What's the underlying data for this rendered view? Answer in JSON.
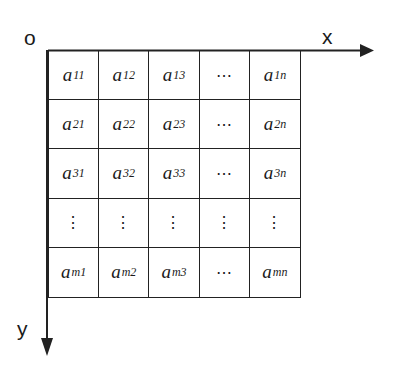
{
  "diagram": {
    "origin_label": "o",
    "x_axis_label": "x",
    "y_axis_label": "y",
    "colors": {
      "line": "#222222",
      "text": "#1a1a1a",
      "background": "#ffffff"
    },
    "matrix": {
      "rows": [
        [
          {
            "base": "a",
            "sub": "11"
          },
          {
            "base": "a",
            "sub": "12"
          },
          {
            "base": "a",
            "sub": "13"
          },
          {
            "ellipsis": "⋯"
          },
          {
            "base": "a",
            "sub": "1n"
          }
        ],
        [
          {
            "base": "a",
            "sub": "21"
          },
          {
            "base": "a",
            "sub": "22"
          },
          {
            "base": "a",
            "sub": "23"
          },
          {
            "ellipsis": "⋯"
          },
          {
            "base": "a",
            "sub": "2n"
          }
        ],
        [
          {
            "base": "a",
            "sub": "31"
          },
          {
            "base": "a",
            "sub": "32"
          },
          {
            "base": "a",
            "sub": "33"
          },
          {
            "ellipsis": "⋯"
          },
          {
            "base": "a",
            "sub": "3n"
          }
        ],
        [
          {
            "vdots": "⋮"
          },
          {
            "vdots": "⋮"
          },
          {
            "vdots": "⋮"
          },
          {
            "vdots": "⋮"
          },
          {
            "vdots": "⋮"
          }
        ],
        [
          {
            "base": "a",
            "sub": "m1"
          },
          {
            "base": "a",
            "sub": "m2"
          },
          {
            "base": "a",
            "sub": "m3"
          },
          {
            "ellipsis": "⋯"
          },
          {
            "base": "a",
            "sub": "mn"
          }
        ]
      ]
    }
  }
}
